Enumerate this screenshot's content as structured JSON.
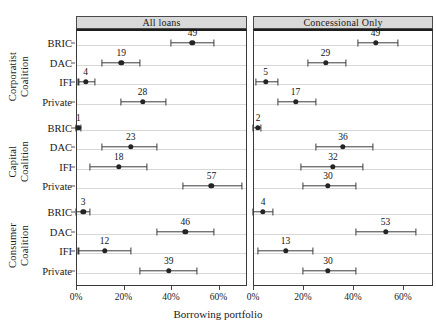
{
  "chart_data": {
    "type": "scatter",
    "title": "",
    "xlabel": "Borrowing portfolio",
    "ylabel": "",
    "xlim": [
      0,
      72
    ],
    "xticks": [
      0,
      20,
      40,
      60
    ],
    "xtick_labels": [
      "0%",
      "20%",
      "40%",
      "60%"
    ],
    "grid": true,
    "legend": "none",
    "panels": [
      {
        "label": "All loans"
      },
      {
        "label": "Concessional Only"
      }
    ],
    "groups": [
      {
        "label": "Corporatist\nCoalition",
        "line1": "Corporatist",
        "line2": "Coalition"
      },
      {
        "label": "Capital\nCoalition",
        "line1": "Capital",
        "line2": "Coalition"
      },
      {
        "label": "Consumer\nCoalition",
        "line1": "Consumer",
        "line2": "Coalition"
      }
    ],
    "categories": [
      "BRIC",
      "DAC",
      "IFI",
      "Private"
    ],
    "series": [
      {
        "panel": "All loans",
        "group": "Corporatist Coalition",
        "points": [
          {
            "category": "BRIC",
            "value": 49,
            "low": 40,
            "high": 58,
            "label": "49"
          },
          {
            "category": "DAC",
            "value": 19,
            "low": 11,
            "high": 27,
            "label": "19"
          },
          {
            "category": "IFI",
            "value": 4,
            "low": 1,
            "high": 8,
            "label": "4"
          },
          {
            "category": "Private",
            "value": 28,
            "low": 19,
            "high": 38,
            "label": "28"
          }
        ]
      },
      {
        "panel": "All loans",
        "group": "Capital Coalition",
        "points": [
          {
            "category": "BRIC",
            "value": 1,
            "low": 0,
            "high": 2,
            "label": "1"
          },
          {
            "category": "DAC",
            "value": 23,
            "low": 11,
            "high": 34,
            "label": "23"
          },
          {
            "category": "IFI",
            "value": 18,
            "low": 6,
            "high": 30,
            "label": "18"
          },
          {
            "category": "Private",
            "value": 57,
            "low": 45,
            "high": 70,
            "label": "57"
          }
        ]
      },
      {
        "panel": "All loans",
        "group": "Consumer Coalition",
        "points": [
          {
            "category": "BRIC",
            "value": 3,
            "low": 0,
            "high": 6,
            "label": "3"
          },
          {
            "category": "DAC",
            "value": 46,
            "low": 34,
            "high": 58,
            "label": "46"
          },
          {
            "category": "IFI",
            "value": 12,
            "low": 1,
            "high": 23,
            "label": "12"
          },
          {
            "category": "Private",
            "value": 39,
            "low": 27,
            "high": 51,
            "label": "39"
          }
        ]
      },
      {
        "panel": "Concessional Only",
        "group": "Corporatist Coalition",
        "points": [
          {
            "category": "BRIC",
            "value": 49,
            "low": 42,
            "high": 58,
            "label": "49"
          },
          {
            "category": "DAC",
            "value": 29,
            "low": 22,
            "high": 37,
            "label": "29"
          },
          {
            "category": "IFI",
            "value": 5,
            "low": 1,
            "high": 10,
            "label": "5"
          },
          {
            "category": "Private",
            "value": 17,
            "low": 10,
            "high": 25,
            "label": "17"
          }
        ]
      },
      {
        "panel": "Concessional Only",
        "group": "Capital Coalition",
        "points": [
          {
            "category": "BRIC",
            "value": 2,
            "low": 0,
            "high": 3,
            "label": "2"
          },
          {
            "category": "DAC",
            "value": 36,
            "low": 25,
            "high": 48,
            "label": "36"
          },
          {
            "category": "IFI",
            "value": 32,
            "low": 19,
            "high": 44,
            "label": "32"
          },
          {
            "category": "Private",
            "value": 30,
            "low": 20,
            "high": 41,
            "label": "30"
          }
        ]
      },
      {
        "panel": "Concessional Only",
        "group": "Consumer Coalition",
        "points": [
          {
            "category": "BRIC",
            "value": 4,
            "low": 0,
            "high": 8,
            "label": "4"
          },
          {
            "category": "DAC",
            "value": 53,
            "low": 41,
            "high": 65,
            "label": "53"
          },
          {
            "category": "IFI",
            "value": 13,
            "low": 2,
            "high": 24,
            "label": "13"
          },
          {
            "category": "Private",
            "value": 30,
            "low": 20,
            "high": 41,
            "label": "30"
          }
        ]
      }
    ]
  },
  "colors": {
    "point": "#242424",
    "interval": "#3c3c3c",
    "grid": "#d7d7d7",
    "panel_strip": "#d9d9d9",
    "panel_border": "#3a3a3a",
    "text": "#1a1a1a"
  }
}
